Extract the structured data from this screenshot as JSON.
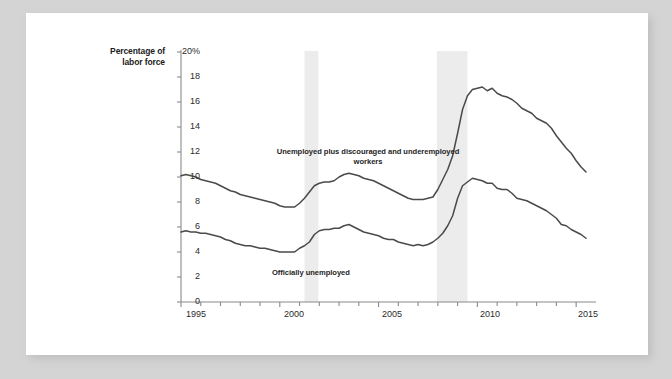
{
  "figure": {
    "axis_title_lines": [
      "Percentage of",
      "labor force"
    ],
    "y_ticks": [
      "20%",
      "18",
      "16",
      "14",
      "12",
      "10",
      "8",
      "6",
      "4",
      "2",
      "0"
    ],
    "x_ticks": [
      "1995",
      "2000",
      "2005",
      "2010",
      "2015"
    ],
    "label_broad": "Unemployed plus discouraged and underemployed workers",
    "label_official": "Officially unemployed"
  },
  "colors": {
    "line": "#4a4a4a",
    "axis": "#8a8a8a",
    "recession_band": "#ececec",
    "paper": "#ffffff",
    "backdrop": "#d4d4d4",
    "text": "#1f1f1f"
  },
  "chart_data": {
    "type": "line",
    "title": "",
    "xlabel": "",
    "ylabel": "Percentage of labor force",
    "xlim": [
      1995.0,
      2015.6
    ],
    "ylim": [
      0,
      20
    ],
    "grid": false,
    "legend": "inline-annotations",
    "x_tick_values": [
      1995,
      2000,
      2005,
      2010,
      2015
    ],
    "y_tick_values": [
      0,
      2,
      4,
      6,
      8,
      10,
      12,
      14,
      16,
      18,
      20
    ],
    "minor_x_tick_interval": 1,
    "shaded_regions": [
      {
        "label": "recession",
        "x0": 2001.25,
        "x1": 2001.95
      },
      {
        "label": "recession",
        "x0": 2007.95,
        "x1": 2009.5
      }
    ],
    "series": [
      {
        "name": "Unemployed plus discouraged and underemployed workers",
        "x": [
          1995.0,
          1995.25,
          1995.5,
          1995.75,
          1996.0,
          1996.25,
          1996.5,
          1996.75,
          1997.0,
          1997.25,
          1997.5,
          1997.75,
          1998.0,
          1998.25,
          1998.5,
          1998.75,
          1999.0,
          1999.25,
          1999.5,
          1999.75,
          2000.0,
          2000.25,
          2000.5,
          2000.75,
          2001.0,
          2001.25,
          2001.5,
          2001.75,
          2002.0,
          2002.25,
          2002.5,
          2002.75,
          2003.0,
          2003.25,
          2003.5,
          2003.75,
          2004.0,
          2004.25,
          2004.5,
          2004.75,
          2005.0,
          2005.25,
          2005.5,
          2005.75,
          2006.0,
          2006.25,
          2006.5,
          2006.75,
          2007.0,
          2007.25,
          2007.5,
          2007.75,
          2008.0,
          2008.25,
          2008.5,
          2008.75,
          2009.0,
          2009.25,
          2009.5,
          2009.75,
          2010.0,
          2010.25,
          2010.5,
          2010.75,
          2011.0,
          2011.25,
          2011.5,
          2011.75,
          2012.0,
          2012.25,
          2012.5,
          2012.75,
          2013.0,
          2013.25,
          2013.5,
          2013.75,
          2014.0,
          2014.25,
          2014.5,
          2014.75,
          2015.0,
          2015.25,
          2015.5
        ],
        "values": [
          10.1,
          10.2,
          10.1,
          10.0,
          9.8,
          9.7,
          9.6,
          9.5,
          9.3,
          9.1,
          8.9,
          8.8,
          8.6,
          8.5,
          8.4,
          8.3,
          8.2,
          8.1,
          8.0,
          7.9,
          7.7,
          7.6,
          7.6,
          7.6,
          7.9,
          8.3,
          8.8,
          9.3,
          9.5,
          9.6,
          9.6,
          9.7,
          10.0,
          10.2,
          10.3,
          10.2,
          10.1,
          9.9,
          9.8,
          9.7,
          9.5,
          9.3,
          9.1,
          8.9,
          8.7,
          8.5,
          8.3,
          8.2,
          8.2,
          8.2,
          8.3,
          8.4,
          9.0,
          9.8,
          10.6,
          11.7,
          13.5,
          15.4,
          16.5,
          17.0,
          17.1,
          17.2,
          16.9,
          17.1,
          16.7,
          16.5,
          16.4,
          16.2,
          15.9,
          15.5,
          15.3,
          15.1,
          14.7,
          14.5,
          14.3,
          13.9,
          13.3,
          12.8,
          12.3,
          11.9,
          11.3,
          10.8,
          10.4
        ]
      },
      {
        "name": "Officially unemployed",
        "x": [
          1995.0,
          1995.25,
          1995.5,
          1995.75,
          1996.0,
          1996.25,
          1996.5,
          1996.75,
          1997.0,
          1997.25,
          1997.5,
          1997.75,
          1998.0,
          1998.25,
          1998.5,
          1998.75,
          1999.0,
          1999.25,
          1999.5,
          1999.75,
          2000.0,
          2000.25,
          2000.5,
          2000.75,
          2001.0,
          2001.25,
          2001.5,
          2001.75,
          2002.0,
          2002.25,
          2002.5,
          2002.75,
          2003.0,
          2003.25,
          2003.5,
          2003.75,
          2004.0,
          2004.25,
          2004.5,
          2004.75,
          2005.0,
          2005.25,
          2005.5,
          2005.75,
          2006.0,
          2006.25,
          2006.5,
          2006.75,
          2007.0,
          2007.25,
          2007.5,
          2007.75,
          2008.0,
          2008.25,
          2008.5,
          2008.75,
          2009.0,
          2009.25,
          2009.5,
          2009.75,
          2010.0,
          2010.25,
          2010.5,
          2010.75,
          2011.0,
          2011.25,
          2011.5,
          2011.75,
          2012.0,
          2012.25,
          2012.5,
          2012.75,
          2013.0,
          2013.25,
          2013.5,
          2013.75,
          2014.0,
          2014.25,
          2014.5,
          2014.75,
          2015.0,
          2015.25,
          2015.5
        ],
        "values": [
          5.6,
          5.7,
          5.6,
          5.6,
          5.5,
          5.5,
          5.4,
          5.3,
          5.2,
          5.0,
          4.9,
          4.7,
          4.6,
          4.5,
          4.5,
          4.4,
          4.3,
          4.3,
          4.2,
          4.1,
          4.0,
          4.0,
          4.0,
          4.0,
          4.3,
          4.5,
          4.8,
          5.4,
          5.7,
          5.8,
          5.8,
          5.9,
          5.9,
          6.1,
          6.2,
          6.0,
          5.8,
          5.6,
          5.5,
          5.4,
          5.3,
          5.1,
          5.0,
          5.0,
          4.8,
          4.7,
          4.6,
          4.5,
          4.6,
          4.5,
          4.6,
          4.8,
          5.1,
          5.5,
          6.1,
          6.9,
          8.3,
          9.3,
          9.6,
          9.9,
          9.8,
          9.7,
          9.5,
          9.5,
          9.1,
          9.0,
          9.0,
          8.7,
          8.3,
          8.2,
          8.1,
          7.9,
          7.7,
          7.5,
          7.3,
          7.0,
          6.7,
          6.2,
          6.1,
          5.8,
          5.6,
          5.4,
          5.1
        ]
      }
    ]
  }
}
